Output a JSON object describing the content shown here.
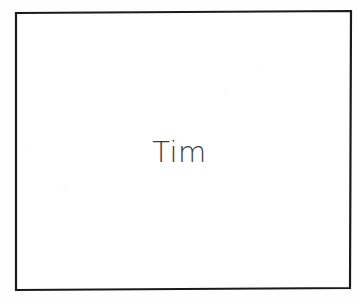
{
  "document": {
    "type": "scanned-diagram",
    "background_color": "#fefefe"
  },
  "figure": {
    "name": "labeled-rectangle",
    "shape": "rectangle",
    "stroke_color": "#1a1a1a",
    "stroke_width_px": 2,
    "fill_color": "#ffffff",
    "bounds": {
      "left": 15,
      "top": 12,
      "right": 351,
      "bottom": 289,
      "width": 336,
      "height": 277
    },
    "label": {
      "text": "Tim",
      "color": "#3c3c3e",
      "font_size_px": 29,
      "font_weight": "light",
      "align": "center",
      "center_x": 182,
      "center_y": 153
    }
  }
}
